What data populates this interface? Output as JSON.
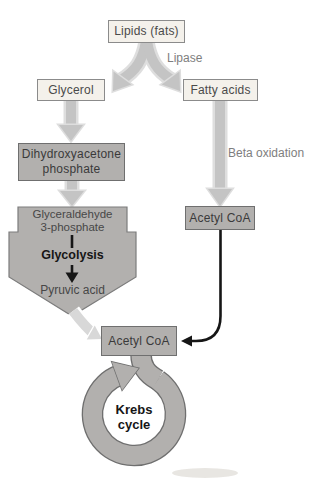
{
  "diagram": {
    "nodes": {
      "lipids": {
        "label": "Lipids (fats)"
      },
      "glycerol": {
        "label": "Glycerol"
      },
      "fatty_acids": {
        "label": "Fatty acids"
      },
      "dhap": {
        "line1": "Dihydroxyacetone",
        "line2": "phosphate"
      },
      "g3p": {
        "line1": "Glyceraldehyde",
        "line2": "3-phosphate"
      },
      "glycolysis": {
        "label": "Glycolysis"
      },
      "pyruvic_acid": {
        "label": "Pyruvic acid"
      },
      "acetyl_coa_right": {
        "label": "Acetyl CoA"
      },
      "acetyl_coa_center": {
        "label": "Acetyl CoA"
      },
      "krebs": {
        "line1": "Krebs",
        "line2": "cycle"
      }
    },
    "edge_labels": {
      "lipase": "Lipase",
      "beta_oxidation": "Beta oxidation"
    },
    "colors": {
      "light_box_fill": "#f4f1eb",
      "light_box_border": "#8b8b8b",
      "gray_fill": "#b2b0ae",
      "gray_border": "#6f6f6f",
      "arrow_gray": "#c4c4c4",
      "arrow_under": "#dedede",
      "arrow_light": "#d8d8d8",
      "label_gray": "#7e7e7e",
      "black": "#161616"
    }
  }
}
